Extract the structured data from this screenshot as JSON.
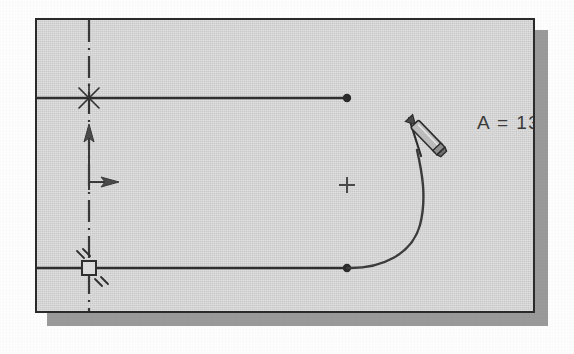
{
  "panel": {
    "name": "cad-sketch-canvas",
    "background_color": "#d2d2d2",
    "border_color": "#2a2a2a",
    "shadow_color": "#9a9a9a"
  },
  "readout": {
    "label": "A = 132.8",
    "clipped": true,
    "color": "#3b3b3b"
  },
  "geometry": {
    "centerline": {
      "name": "vertical-centerline",
      "x": 87,
      "y_top": 18,
      "y_bottom": 313,
      "style": "dash-dot"
    },
    "top_line": {
      "name": "top-horizontal-line",
      "x1": 35,
      "y1": 96,
      "x2": 345,
      "y2": 96
    },
    "bottom_line": {
      "name": "bottom-horizontal-line",
      "x1": 35,
      "y1": 266,
      "x2": 345,
      "y2": 266
    },
    "arc": {
      "name": "arc-being-drawn",
      "start_x": 345,
      "start_y": 266,
      "end_x": 415,
      "end_y": 148,
      "center_x": 345,
      "center_y": 183
    },
    "arc_center_mark": {
      "name": "arc-center-crosshair",
      "x": 345,
      "y": 183
    },
    "endpoint_dots": [
      {
        "name": "top-line-endpoint-dot",
        "x": 345,
        "y": 96
      },
      {
        "name": "bottom-line-endpoint-dot",
        "x": 345,
        "y": 266
      }
    ]
  },
  "constraints": [
    {
      "name": "coincident-constraint-asterisk",
      "symbol": "asterisk",
      "x": 87,
      "y": 96
    },
    {
      "name": "fixed-constraint-square",
      "symbol": "square-with-hatches",
      "x": 87,
      "y": 266
    },
    {
      "name": "vertical-direction-arrow",
      "symbol": "arrow-up",
      "x": 87,
      "y": 133
    },
    {
      "name": "horizontal-direction-arrow",
      "symbol": "arrow-right",
      "x": 87,
      "y": 180
    }
  ],
  "cursor": {
    "name": "pencil-cursor",
    "tip_x": 407,
    "tip_y": 116,
    "angle_deg": 45,
    "body_color": "#b9b9b9",
    "outline_color": "#2e2e2e"
  }
}
